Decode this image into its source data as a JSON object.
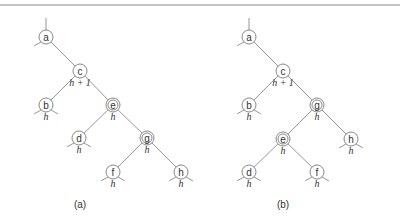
{
  "figure": {
    "rule": {
      "x1": 0,
      "x2": 400,
      "y": 5
    },
    "trees": [
      {
        "id": "a",
        "caption": "(a)",
        "caption_pos": {
          "x": 80,
          "y": 208
        },
        "nodes": [
          {
            "id": "a",
            "label": "a",
            "x": 46,
            "y": 37,
            "double": false,
            "h": null,
            "stubs": [
              "up",
              "down-left"
            ]
          },
          {
            "id": "c",
            "label": "c",
            "x": 80,
            "y": 71,
            "double": false,
            "h": "h + 1",
            "stubs": []
          },
          {
            "id": "b",
            "label": "b",
            "x": 46,
            "y": 105,
            "double": false,
            "h": "h",
            "stubs": [
              "down-left",
              "down-right"
            ]
          },
          {
            "id": "e",
            "label": "e",
            "x": 113,
            "y": 105,
            "double": true,
            "h": "h",
            "stubs": []
          },
          {
            "id": "d",
            "label": "d",
            "x": 79,
            "y": 138,
            "double": false,
            "h": "h",
            "stubs": [
              "down-left",
              "down-right"
            ]
          },
          {
            "id": "g",
            "label": "g",
            "x": 147,
            "y": 138,
            "double": true,
            "h": "h",
            "stubs": []
          },
          {
            "id": "f",
            "label": "f",
            "x": 113,
            "y": 172,
            "double": false,
            "h": "h",
            "stubs": [
              "down-left",
              "down-right"
            ]
          },
          {
            "id": "h",
            "label": "h",
            "x": 181,
            "y": 172,
            "double": false,
            "h": "h",
            "stubs": [
              "down-left",
              "down-right"
            ]
          }
        ],
        "edges": [
          [
            "a",
            "c"
          ],
          [
            "c",
            "b"
          ],
          [
            "c",
            "e"
          ],
          [
            "e",
            "d"
          ],
          [
            "e",
            "g"
          ],
          [
            "g",
            "f"
          ],
          [
            "g",
            "h"
          ]
        ]
      },
      {
        "id": "b",
        "caption": "(b)",
        "caption_pos": {
          "x": 283,
          "y": 208
        },
        "nodes": [
          {
            "id": "a",
            "label": "a",
            "x": 249,
            "y": 37,
            "double": false,
            "h": null,
            "stubs": [
              "up",
              "down-left"
            ]
          },
          {
            "id": "c",
            "label": "c",
            "x": 283,
            "y": 71,
            "double": false,
            "h": "h + 1",
            "stubs": []
          },
          {
            "id": "b",
            "label": "b",
            "x": 249,
            "y": 105,
            "double": false,
            "h": "h",
            "stubs": [
              "down-left",
              "down-right"
            ]
          },
          {
            "id": "g",
            "label": "g",
            "x": 317,
            "y": 105,
            "double": true,
            "h": "h",
            "stubs": []
          },
          {
            "id": "e",
            "label": "e",
            "x": 283,
            "y": 139,
            "double": true,
            "h": "h",
            "stubs": []
          },
          {
            "id": "h",
            "label": "h",
            "x": 351,
            "y": 139,
            "double": false,
            "h": "h",
            "stubs": [
              "down-left",
              "down-right"
            ]
          },
          {
            "id": "d",
            "label": "d",
            "x": 249,
            "y": 172,
            "double": false,
            "h": "h",
            "stubs": [
              "down-left",
              "down-right"
            ]
          },
          {
            "id": "f",
            "label": "f",
            "x": 317,
            "y": 172,
            "double": false,
            "h": "h",
            "stubs": [
              "down-left",
              "down-right"
            ]
          }
        ],
        "edges": [
          [
            "a",
            "c"
          ],
          [
            "c",
            "b"
          ],
          [
            "c",
            "g"
          ],
          [
            "g",
            "e"
          ],
          [
            "g",
            "h"
          ],
          [
            "e",
            "d"
          ],
          [
            "e",
            "f"
          ]
        ]
      }
    ],
    "style": {
      "node_radius": 7,
      "inner_radius": 5,
      "line_color": "#8a8a8a",
      "text_color": "#333333"
    }
  }
}
